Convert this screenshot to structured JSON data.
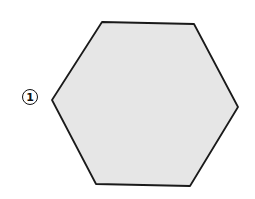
{
  "diagram": {
    "shape": "hexagon",
    "label": "1",
    "fill_color": "#e6e6e6",
    "stroke_color": "#1a1a1a",
    "vertices": [
      [
        102,
        22
      ],
      [
        194,
        24
      ],
      [
        238,
        107
      ],
      [
        190,
        186
      ],
      [
        96,
        184
      ],
      [
        52,
        100
      ]
    ]
  }
}
